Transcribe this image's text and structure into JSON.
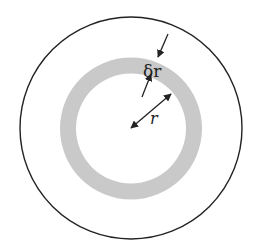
{
  "diagram": {
    "labels": {
      "delta_r": "δr",
      "r": "r"
    },
    "colors": {
      "background": "#ffffff",
      "outer_circle_stroke": "#222222",
      "ring_fill": "#c9c9c9",
      "arrow": "#222222"
    },
    "shapes": {
      "outer_circle": {
        "cx": 131,
        "cy": 128,
        "r": 111
      },
      "shaded_ring": {
        "cx": 131,
        "cy": 128.5,
        "outer_r": 71,
        "inner_r": 55
      }
    }
  }
}
